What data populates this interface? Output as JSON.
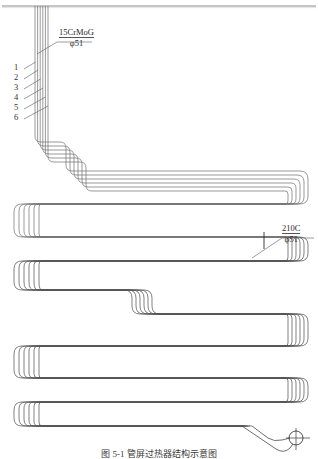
{
  "figure": {
    "title": "管屏过热器结构示意图",
    "caption": "图 5-1  管屏过热器结构示意图",
    "kind": "engineering-line-drawing"
  },
  "callouts": [
    {
      "id": "upper-material",
      "material": "15CrMoG",
      "spec": "φ51",
      "x": 60,
      "y": 29
    },
    {
      "id": "lower-material",
      "material": "210C",
      "spec": "φ51",
      "x": 289,
      "y": 225
    }
  ],
  "tube_labels": [
    {
      "index": "1",
      "x": 18,
      "y": 67
    },
    {
      "index": "2",
      "x": 18,
      "y": 77
    },
    {
      "index": "3",
      "x": 18,
      "y": 87
    },
    {
      "index": "4",
      "x": 18,
      "y": 97
    },
    {
      "index": "5",
      "x": 18,
      "y": 107
    },
    {
      "index": "6",
      "x": 18,
      "y": 117
    }
  ],
  "colors": {
    "line": "#6b6b6b",
    "line_dark": "#3c3c3c",
    "header": "#8a8a8a",
    "text": "#2a2a2a",
    "background": "#ffffff"
  },
  "geometry": {
    "tube_count": 6,
    "header_line_y": 6,
    "riser_x": 40,
    "serpentine_passes": 8,
    "outlet_marker": {
      "cx": 296,
      "cy": 438,
      "r": 7
    }
  }
}
